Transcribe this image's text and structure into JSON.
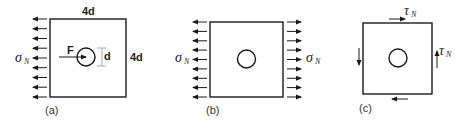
{
  "panels": [
    {
      "id": "a",
      "caption": "(a)",
      "width_label": "4d",
      "height_label": "4d",
      "hole_label": "d",
      "force_label": "F",
      "stress_label": "σ",
      "stress_subscript": "N"
    },
    {
      "id": "b",
      "caption": "(b)",
      "left_stress_label": "σ",
      "left_stress_subscript": "N",
      "right_stress_label": "σ",
      "right_stress_subscript": "N"
    },
    {
      "id": "c",
      "caption": "(c)",
      "top_shear_label": "τ",
      "top_shear_subscript": "N",
      "right_shear_label": "τ",
      "right_shear_subscript": "N"
    }
  ],
  "colors": {
    "line": "#1a1a1a",
    "text": "#222222"
  }
}
